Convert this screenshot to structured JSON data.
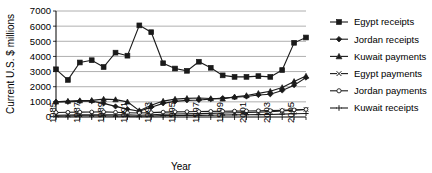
{
  "chart_data": {
    "type": "line",
    "title": "",
    "xlabel": "Year",
    "ylabel": "Current U.S. $ millions",
    "ylim": [
      0,
      7000
    ],
    "ytick_labels": [
      "0",
      "1000",
      "2000",
      "3000",
      "4000",
      "5000",
      "6000",
      "7000"
    ],
    "ytick_values": [
      0,
      1000,
      2000,
      3000,
      4000,
      5000,
      6000,
      7000
    ],
    "grid": true,
    "legend_position": "right",
    "x": [
      1985,
      1986,
      1987,
      1988,
      1989,
      1990,
      1991,
      1992,
      1993,
      1994,
      1995,
      1996,
      1997,
      1998,
      1999,
      2000,
      2001,
      2002,
      2003,
      2004,
      2005,
      2006
    ],
    "xtick_labels": [
      "1985",
      "1987",
      "1989",
      "1991",
      "1993",
      "1995",
      "1997",
      "1999",
      "2001",
      "2003",
      "2005"
    ],
    "xtick_values": [
      1985,
      1987,
      1989,
      1991,
      1993,
      1995,
      1997,
      1999,
      2001,
      2003,
      2005
    ],
    "series": [
      {
        "name": "Egypt receipts",
        "marker": "square",
        "values": [
          3150,
          2450,
          3600,
          3750,
          3300,
          4250,
          4050,
          6050,
          5600,
          3550,
          3200,
          3050,
          3650,
          3250,
          2750,
          2650,
          2650,
          2700,
          2650,
          3100,
          4900,
          5250
        ]
      },
      {
        "name": "Jordan receipts",
        "marker": "diamond",
        "values": [
          1000,
          1000,
          1050,
          1050,
          900,
          700,
          520,
          380,
          650,
          900,
          1030,
          1100,
          1120,
          1180,
          1250,
          1300,
          1350,
          1450,
          1500,
          1750,
          2100,
          2600
        ]
      },
      {
        "name": "Kuwait payments",
        "marker": "triangle",
        "values": [
          1000,
          1050,
          1080,
          1100,
          1180,
          1150,
          1000,
          420,
          780,
          1050,
          1180,
          1230,
          1250,
          1220,
          1200,
          1330,
          1420,
          1560,
          1700,
          1950,
          2350,
          2700
        ]
      },
      {
        "name": "Egypt payments",
        "marker": "x",
        "values": [
          120,
          130,
          140,
          150,
          150,
          150,
          150,
          120,
          150,
          180,
          200,
          210,
          220,
          240,
          260,
          280,
          300,
          320,
          350,
          400,
          450,
          500
        ]
      },
      {
        "name": "Jordan payments",
        "marker": "circle",
        "values": [
          300,
          310,
          320,
          330,
          340,
          310,
          280,
          260,
          290,
          320,
          340,
          350,
          360,
          370,
          380,
          390,
          400,
          410,
          420,
          440,
          470,
          500
        ]
      },
      {
        "name": "Kuwait receipts",
        "marker": "plus",
        "values": [
          60,
          70,
          80,
          80,
          80,
          70,
          60,
          50,
          70,
          90,
          100,
          110,
          110,
          120,
          130,
          140,
          150,
          160,
          170,
          190,
          210,
          230
        ]
      }
    ]
  },
  "legend": {
    "items": [
      {
        "label": "Egypt receipts",
        "marker": "square"
      },
      {
        "label": "Jordan receipts",
        "marker": "diamond"
      },
      {
        "label": "Kuwait payments",
        "marker": "triangle"
      },
      {
        "label": "Egypt payments",
        "marker": "x"
      },
      {
        "label": "Jordan payments",
        "marker": "circle"
      },
      {
        "label": "Kuwait receipts",
        "marker": "plus"
      }
    ]
  },
  "colors": {
    "ink": "#1a1a1a",
    "grid": "#9a9a9a",
    "background": "#ffffff"
  }
}
